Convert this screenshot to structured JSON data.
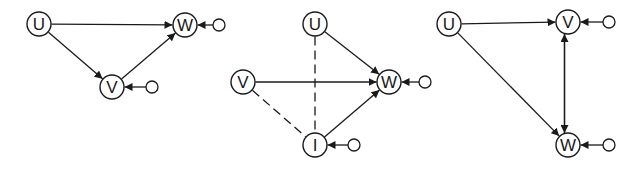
{
  "colors": {
    "ink": "#1a1a1a",
    "background": "#ffffff"
  },
  "node_radius": 12,
  "source_radius": 6,
  "diagrams": [
    {
      "id": "diagram-1",
      "nodes": [
        {
          "id": "U",
          "label": "U",
          "x": 39,
          "y": 24
        },
        {
          "id": "W",
          "label": "W",
          "x": 185,
          "y": 25
        },
        {
          "id": "V",
          "label": "V",
          "x": 112,
          "y": 87
        }
      ],
      "sources": [
        {
          "target": "W",
          "x": 219,
          "y": 25
        },
        {
          "target": "V",
          "x": 152,
          "y": 87
        }
      ],
      "edges": [
        {
          "from": "U",
          "to": "W",
          "style": "solid",
          "arrow": true
        },
        {
          "from": "U",
          "to": "V",
          "style": "solid",
          "arrow": true
        },
        {
          "from": "V",
          "to": "W",
          "style": "solid",
          "arrow": true
        }
      ]
    },
    {
      "id": "diagram-2",
      "nodes": [
        {
          "id": "U",
          "label": "U",
          "x": 315,
          "y": 24
        },
        {
          "id": "V",
          "label": "V",
          "x": 243,
          "y": 82
        },
        {
          "id": "W",
          "label": "W",
          "x": 389,
          "y": 82
        },
        {
          "id": "I",
          "label": "I",
          "x": 315,
          "y": 145
        }
      ],
      "sources": [
        {
          "target": "W",
          "x": 425,
          "y": 82
        },
        {
          "target": "I",
          "x": 354,
          "y": 145
        }
      ],
      "edges": [
        {
          "from": "U",
          "to": "W",
          "style": "solid",
          "arrow": true
        },
        {
          "from": "V",
          "to": "W",
          "style": "solid",
          "arrow": true
        },
        {
          "from": "I",
          "to": "W",
          "style": "solid",
          "arrow": true
        },
        {
          "from": "U",
          "to": "I",
          "style": "dashed",
          "arrow": false
        },
        {
          "from": "V",
          "to": "I",
          "style": "dashed",
          "arrow": false
        }
      ]
    },
    {
      "id": "diagram-3",
      "nodes": [
        {
          "id": "U",
          "label": "U",
          "x": 449,
          "y": 24
        },
        {
          "id": "V",
          "label": "V",
          "x": 568,
          "y": 22
        },
        {
          "id": "W",
          "label": "W",
          "x": 568,
          "y": 145
        }
      ],
      "sources": [
        {
          "target": "V",
          "x": 609,
          "y": 22
        },
        {
          "target": "W",
          "x": 609,
          "y": 145
        }
      ],
      "edges": [
        {
          "from": "U",
          "to": "V",
          "style": "solid",
          "arrow": true
        },
        {
          "from": "U",
          "to": "W",
          "style": "solid",
          "arrow": true
        },
        {
          "from": "W",
          "to": "V",
          "style": "solid",
          "arrow": true,
          "offset": -3.5
        },
        {
          "from": "V",
          "to": "W",
          "style": "solid",
          "arrow": true,
          "offset": 3.5
        }
      ]
    }
  ]
}
